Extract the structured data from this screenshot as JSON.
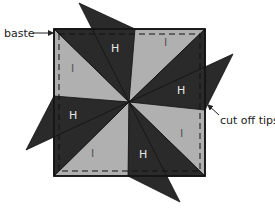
{
  "diagram": {
    "type": "quilt-block-pinwheel",
    "colors": {
      "dark": "#2a2a2a",
      "light": "#b0b0b0",
      "outline": "#111111",
      "label_text": "#222222"
    },
    "labels": {
      "baste": "baste",
      "cut_off_tips": "cut off tips"
    },
    "pieces": {
      "H": "H",
      "I": "I"
    }
  }
}
